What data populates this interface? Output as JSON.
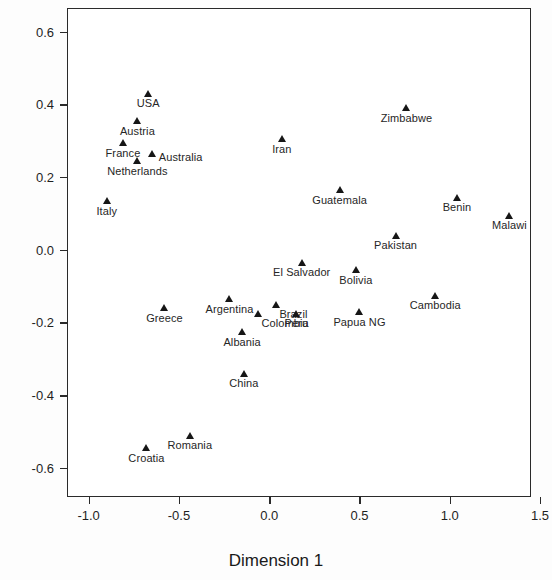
{
  "chart_data": {
    "type": "scatter",
    "title": "",
    "xlabel": "Dimension 1",
    "ylabel": "Dimension 2",
    "xlim": [
      -1.12,
      1.45
    ],
    "ylim": [
      -0.68,
      0.665
    ],
    "xticks": [
      -1.0,
      -0.5,
      0.0,
      0.5,
      1.0,
      1.5
    ],
    "xticklabels": [
      "-1.0",
      "-0.5",
      "0.0",
      "0.5",
      "1.0",
      "1.5"
    ],
    "yticks": [
      0.6,
      0.4,
      0.2,
      0.0,
      -0.2,
      -0.4,
      -0.6
    ],
    "yticklabels": [
      "0.6",
      "0.4",
      "0.2",
      "0.0",
      "-0.2",
      "-0.4",
      "-0.6"
    ],
    "grid": false,
    "legend": null,
    "marker": "triangle",
    "marker_color": "#161616",
    "points": [
      {
        "label": "USA",
        "x": -0.67,
        "y": 0.43,
        "label_pos": "below"
      },
      {
        "label": "Austria",
        "x": -0.73,
        "y": 0.355,
        "label_pos": "below"
      },
      {
        "label": "France",
        "x": -0.81,
        "y": 0.295,
        "label_pos": "below"
      },
      {
        "label": "Australia",
        "x": -0.65,
        "y": 0.265,
        "label_pos": "right"
      },
      {
        "label": "Netherlands",
        "x": -0.73,
        "y": 0.245,
        "label_pos": "below"
      },
      {
        "label": "Italy",
        "x": -0.9,
        "y": 0.135,
        "label_pos": "below"
      },
      {
        "label": "Iran",
        "x": 0.07,
        "y": 0.305,
        "label_pos": "below"
      },
      {
        "label": "Zimbabwe",
        "x": 0.76,
        "y": 0.39,
        "label_pos": "below"
      },
      {
        "label": "Guatemala",
        "x": 0.39,
        "y": 0.165,
        "label_pos": "below"
      },
      {
        "label": "Benin",
        "x": 1.04,
        "y": 0.145,
        "label_pos": "below"
      },
      {
        "label": "Pakistan",
        "x": 0.7,
        "y": 0.04,
        "label_pos": "below"
      },
      {
        "label": "Malawi",
        "x": 1.33,
        "y": 0.095,
        "label_pos": "below"
      },
      {
        "label": "El Salvador",
        "x": 0.18,
        "y": -0.035,
        "label_pos": "below"
      },
      {
        "label": "Bolivia",
        "x": 0.48,
        "y": -0.055,
        "label_pos": "below"
      },
      {
        "label": "Argentina",
        "x": -0.22,
        "y": -0.135,
        "label_pos": "below"
      },
      {
        "label": "Cambodia",
        "x": 0.92,
        "y": -0.125,
        "label_pos": "below"
      },
      {
        "label": "Brazil",
        "x": 0.04,
        "y": -0.15,
        "label_pos": "below-right"
      },
      {
        "label": "Greece",
        "x": -0.58,
        "y": -0.16,
        "label_pos": "below"
      },
      {
        "label": "Peru",
        "x": 0.15,
        "y": -0.175,
        "label_pos": "below"
      },
      {
        "label": "Papua NG",
        "x": 0.5,
        "y": -0.17,
        "label_pos": "below"
      },
      {
        "label": "Colombia",
        "x": -0.06,
        "y": -0.175,
        "label_pos": "below-right"
      },
      {
        "label": "Albania",
        "x": -0.15,
        "y": -0.225,
        "label_pos": "below"
      },
      {
        "label": "China",
        "x": -0.14,
        "y": -0.34,
        "label_pos": "below"
      },
      {
        "label": "Romania",
        "x": -0.44,
        "y": -0.51,
        "label_pos": "below"
      },
      {
        "label": "Croatia",
        "x": -0.68,
        "y": -0.545,
        "label_pos": "below"
      }
    ]
  }
}
